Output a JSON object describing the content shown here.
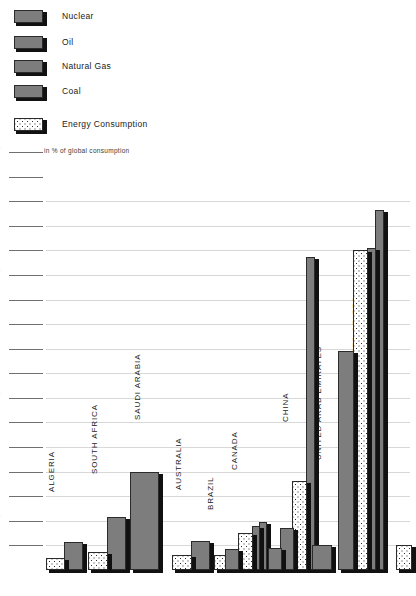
{
  "legend": {
    "items": [
      {
        "label": "Nuclear",
        "swatch": "solid-gray-swatch"
      },
      {
        "label": "Oil",
        "swatch": "solid-gray-swatch"
      },
      {
        "label": "Natural Gas",
        "swatch": "solid-gray-swatch"
      },
      {
        "label": "Coal",
        "swatch": "solid-gray-swatch"
      }
    ],
    "consumption": {
      "label": "Energy Consumption",
      "swatch": "dotted-swatch"
    },
    "unit_note": "in % of global consumption"
  },
  "colors": {
    "bar_fill": "#7d7d7d",
    "bar_outline": "#2b2b2b",
    "shadow": "#111111",
    "gridline": "#d8d8d8",
    "tick_rule": "#707070",
    "background": "#ffffff"
  },
  "chart_data": {
    "type": "bar",
    "title": "",
    "subtitle": "",
    "xlabel": "",
    "ylabel": "in % of global consumption",
    "ylim": [
      0,
      34
    ],
    "ytick_step": 2,
    "ytick_labels": [
      "2",
      "4",
      "6",
      "8",
      "10",
      "12",
      "14",
      "16",
      "18",
      "20",
      "22",
      "24",
      "26",
      "28",
      "30",
      "32",
      "34"
    ],
    "grid": true,
    "legend_position": "top-left",
    "series": [
      {
        "name": "Nuclear"
      },
      {
        "name": "Oil"
      },
      {
        "name": "Natural Gas"
      },
      {
        "name": "Coal"
      },
      {
        "name": "Energy Consumption"
      }
    ],
    "categories": [
      "ALGERIA",
      "SOUTH AFRICA",
      "SAUDI ARABIA",
      "AUSTRALIA",
      "BRAZIL",
      "CANADA",
      "CHINA",
      "UNITED ARAB EMIRATES",
      "UNITED STATES"
    ],
    "groups": [
      {
        "category": "ALGERIA",
        "bars": [
          {
            "series": "Energy Consumption",
            "value": 1.0,
            "pattern": "dotted"
          },
          {
            "series": "Natural Gas",
            "value": 2.3,
            "pattern": "solid"
          }
        ]
      },
      {
        "category": "SOUTH AFRICA",
        "bars": [
          {
            "series": "Energy Consumption",
            "value": 1.5,
            "pattern": "dotted"
          },
          {
            "series": "Coal",
            "value": 4.3,
            "pattern": "solid"
          }
        ]
      },
      {
        "category": "SAUDI ARABIA",
        "bars": [
          {
            "series": "Oil",
            "value": 8.0,
            "pattern": "solid"
          }
        ]
      },
      {
        "category": "AUSTRALIA",
        "bars": [
          {
            "series": "Energy Consumption",
            "value": 1.2,
            "pattern": "dotted"
          },
          {
            "series": "Coal",
            "value": 2.4,
            "pattern": "solid"
          }
        ]
      },
      {
        "category": "BRAZIL",
        "bars": [
          {
            "series": "Energy Consumption",
            "value": 1.2,
            "pattern": "dotted"
          }
        ]
      },
      {
        "category": "CANADA",
        "bars": [
          {
            "series": "Nuclear",
            "value": 1.7,
            "pattern": "solid"
          },
          {
            "series": "Energy Consumption",
            "value": 3.0,
            "pattern": "dotted"
          },
          {
            "series": "Oil",
            "value": 3.6,
            "pattern": "solid"
          },
          {
            "series": "Natural Gas",
            "value": 3.9,
            "pattern": "solid"
          }
        ]
      },
      {
        "category": "CHINA",
        "bars": [
          {
            "series": "Nuclear",
            "value": 1.8,
            "pattern": "solid"
          },
          {
            "series": "Oil",
            "value": 3.4,
            "pattern": "solid"
          },
          {
            "series": "Energy Consumption",
            "value": 7.2,
            "pattern": "dotted"
          },
          {
            "series": "Coal",
            "value": 25.5,
            "pattern": "solid"
          }
        ]
      },
      {
        "category": "UNITED ARAB EMIRATES",
        "bars": [
          {
            "series": "Oil",
            "value": 2.0,
            "pattern": "solid"
          }
        ]
      },
      {
        "category": "UNITED STATES",
        "bars": [
          {
            "series": "Coal",
            "value": 17.8,
            "pattern": "solid"
          },
          {
            "series": "Energy Consumption",
            "value": 26.0,
            "pattern": "dotted"
          },
          {
            "series": "Natural Gas",
            "value": 26.2,
            "pattern": "solid"
          },
          {
            "series": "Oil",
            "value": 29.3,
            "pattern": "solid"
          }
        ]
      },
      {
        "category": "",
        "bars": [
          {
            "series": "Energy Consumption",
            "value": 2.0,
            "pattern": "dotted"
          }
        ]
      }
    ]
  }
}
